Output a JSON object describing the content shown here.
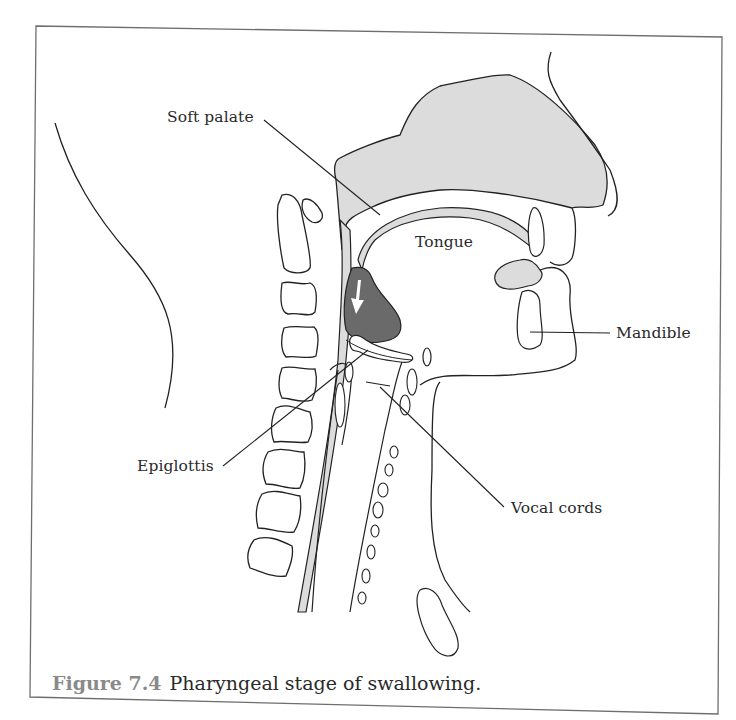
{
  "figure": {
    "caption_number": "Figure 7.4",
    "caption_text": "Pharyngeal stage of swallowing.",
    "labels": {
      "soft_palate": "Soft palate",
      "tongue": "Tongue",
      "mandible": "Mandible",
      "epiglottis": "Epiglottis",
      "vocal_cords": "Vocal cords"
    },
    "colors": {
      "frame_stroke": "#6e6e6e",
      "line": "#222222",
      "light_fill": "#dcdcdc",
      "bolus_fill": "#6a6a6a",
      "arrow_fill": "#ffffff",
      "caption_number": "#8a8a8a",
      "text": "#2a2a2a"
    },
    "icons": {
      "bolus_direction": "arrow-down-icon"
    }
  }
}
